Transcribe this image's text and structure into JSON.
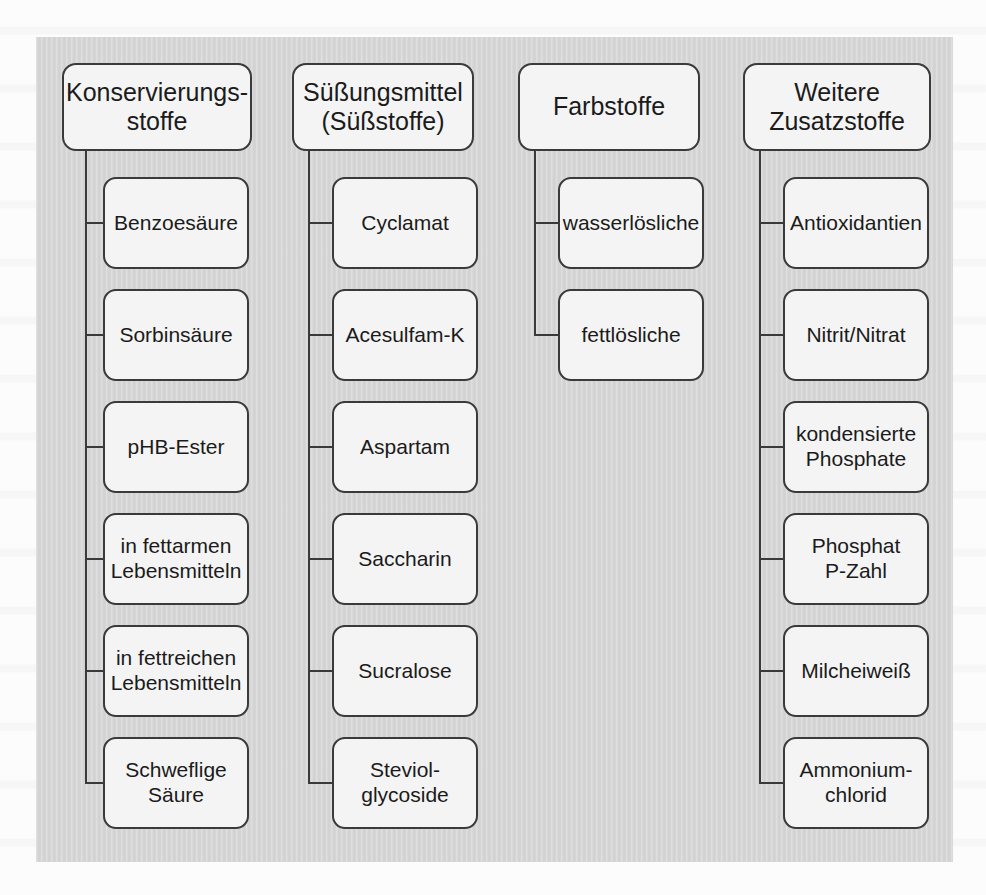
{
  "diagram": {
    "panel_color": "#d6d6d6",
    "node_fill": "#f4f4f4",
    "node_border": "#3a3a3a",
    "text_color": "#1b1b1b",
    "columns": [
      {
        "id": "konservierungsstoffe",
        "root": "Konservierungs-\nstoffe",
        "children": [
          "Benzoesäure",
          "Sorbinsäure",
          "pHB-Ester",
          "in fettarmen\nLebensmitteln",
          "in fettreichen\nLebensmitteln",
          "Schweflige\nSäure"
        ]
      },
      {
        "id": "suessungsmittel",
        "root": "Süßungsmittel\n(Süßstoffe)",
        "children": [
          "Cyclamat",
          "Acesulfam-K",
          "Aspartam",
          "Saccharin",
          "Sucralose",
          "Steviol-\nglycoside"
        ]
      },
      {
        "id": "farbstoffe",
        "root": "Farbstoffe",
        "children": [
          "wasserlösliche",
          "fettlösliche"
        ]
      },
      {
        "id": "weitere-zusatzstoffe",
        "root": "Weitere\nZusatzstoffe",
        "children": [
          "Antioxidantien",
          "Nitrit/Nitrat",
          "kondensierte\nPhosphate",
          "Phosphat\nP-Zahl",
          "Milcheiweiß",
          "Ammonium-\nchlorid"
        ]
      }
    ]
  }
}
